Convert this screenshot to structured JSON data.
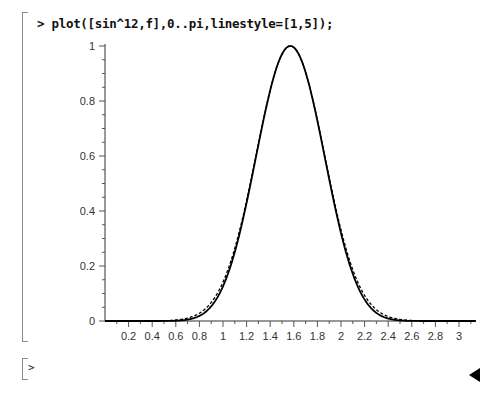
{
  "worksheet": {
    "input_command": "> plot([sin^12,f],0..pi,linestyle=[1,5]);",
    "next_prompt": ">"
  },
  "chart_data": {
    "type": "line",
    "title": "",
    "xlabel": "",
    "ylabel": "",
    "xlim": [
      0,
      3.14159
    ],
    "ylim": [
      0,
      1
    ],
    "grid": false,
    "legend": null,
    "x_ticks": [
      "0.2",
      "0.4",
      "0.6",
      "0.8",
      "1",
      "1.2",
      "1.4",
      "1.6",
      "1.8",
      "2",
      "2.2",
      "2.4",
      "2.6",
      "2.8",
      "3"
    ],
    "y_ticks": [
      "0",
      "0.2",
      "0.4",
      "0.6",
      "0.8",
      "1"
    ],
    "series": [
      {
        "name": "sin^12",
        "linestyle": "solid",
        "source": "read from image",
        "x": [
          0.5,
          0.6,
          0.7,
          0.8,
          0.9,
          1.0,
          1.1,
          1.2,
          1.3,
          1.4,
          1.5,
          1.5708,
          1.6,
          1.7,
          1.8,
          1.9,
          2.0,
          2.1,
          2.2,
          2.3,
          2.4,
          2.5,
          2.6,
          2.7
        ],
        "values": [
          0.0001,
          0.0006,
          0.0025,
          0.0077,
          0.0197,
          0.0439,
          0.088,
          0.1611,
          0.2713,
          0.4193,
          0.595,
          1.0,
          0.9951,
          0.9018,
          0.7403,
          0.5492,
          0.368,
          0.2206,
          0.1172,
          0.0553,
          0.0227,
          0.0079,
          0.0023,
          0.0005
        ]
      },
      {
        "name": "f",
        "linestyle": "dashed",
        "source": "illustrative approximation; f is not defined anywhere in the screenshot",
        "approximation": "exp(-(x-pi/2)^2*6)",
        "note": "Drawn only to mimic the dashed curve's overlap with sin^12. Not actual values of f."
      }
    ]
  }
}
